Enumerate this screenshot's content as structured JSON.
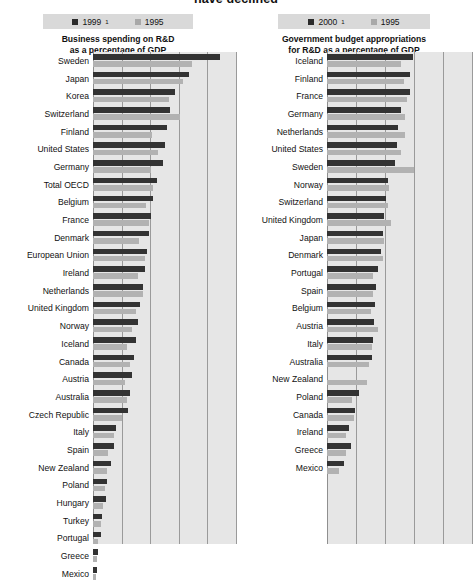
{
  "headline": "have declined",
  "charts": [
    {
      "id": "business-rd",
      "subtitle_line1": "Business spending on R&D",
      "subtitle_line2": "as a percentage of GDP",
      "legend": [
        {
          "label": "1999",
          "note": "1",
          "color": "#333333"
        },
        {
          "label": "1995",
          "note": "",
          "color": "#b2b2b2"
        }
      ],
      "categories": [
        "Sweden",
        "Japan",
        "Korea",
        "Switzerland",
        "Finland",
        "United States",
        "Germany",
        "Total OECD",
        "Belgium",
        "France",
        "Denmark",
        "European Union",
        "Ireland",
        "Netherlands",
        "United Kingdom",
        "Norway",
        "Iceland",
        "Canada",
        "Austria",
        "Australia",
        "Czech Republic",
        "Italy",
        "Spain",
        "New Zealand",
        "Poland",
        "Hungary",
        "Turkey",
        "Portugal",
        "Greece",
        "Mexico"
      ],
      "series": [
        {
          "name": "1999",
          "values": [
            2.85,
            2.15,
            1.84,
            1.73,
            1.65,
            1.6,
            1.56,
            1.43,
            1.35,
            1.29,
            1.25,
            1.2,
            1.16,
            1.11,
            1.06,
            1.0,
            0.96,
            0.92,
            0.87,
            0.82,
            0.78,
            0.52,
            0.46,
            0.4,
            0.31,
            0.28,
            0.21,
            0.17,
            0.11,
            0.09
          ]
        },
        {
          "name": "1995",
          "values": [
            2.22,
            2.02,
            1.71,
            1.94,
            1.31,
            1.45,
            1.29,
            1.34,
            1.19,
            1.26,
            1.03,
            1.16,
            1.01,
            1.12,
            0.97,
            0.87,
            0.77,
            0.83,
            0.72,
            0.77,
            0.66,
            0.46,
            0.34,
            0.32,
            0.27,
            0.23,
            0.17,
            0.12,
            0.09,
            0.06
          ]
        }
      ],
      "axis": {
        "max": 3.2,
        "gridlines": [
          0.0,
          0.64,
          1.28,
          1.92,
          2.56,
          3.2
        ]
      }
    },
    {
      "id": "government-rd",
      "subtitle_line1": "Government budget appropriations",
      "subtitle_line2": "for R&D as a percentage of GDP",
      "legend": [
        {
          "label": "2000",
          "note": "1",
          "color": "#333333"
        },
        {
          "label": "1995",
          "note": "",
          "color": "#b2b2b2"
        }
      ],
      "categories": [
        "Iceland",
        "Finland",
        "France",
        "Germany",
        "Netherlands",
        "United States",
        "Sweden",
        "Norway",
        "Switzerland",
        "United Kingdom",
        "Japan",
        "Denmark",
        "Portugal",
        "Spain",
        "Belgium",
        "Austria",
        "Italy",
        "Australia",
        "New Zealand",
        "Poland",
        "Canada",
        "Ireland",
        "Greece",
        "Mexico"
      ],
      "series": [
        {
          "name": "2000",
          "values": [
            1.02,
            0.99,
            0.98,
            0.88,
            0.84,
            0.83,
            0.81,
            0.72,
            0.7,
            0.68,
            0.66,
            0.64,
            0.6,
            0.58,
            0.57,
            0.56,
            0.55,
            0.53,
            0.0,
            0.38,
            0.33,
            0.26,
            0.28,
            0.2
          ]
        },
        {
          "name": "1995",
          "values": [
            0.88,
            0.91,
            0.95,
            0.93,
            0.92,
            0.88,
            1.03,
            0.74,
            0.72,
            0.76,
            0.68,
            0.66,
            0.55,
            0.54,
            0.52,
            0.61,
            0.53,
            0.5,
            0.47,
            0.3,
            0.32,
            0.23,
            0.22,
            0.14
          ]
        }
      ],
      "axis": {
        "max": 1.72,
        "gridlines": [
          0.0,
          0.344,
          0.688,
          1.032,
          1.376,
          1.72
        ]
      }
    }
  ]
}
